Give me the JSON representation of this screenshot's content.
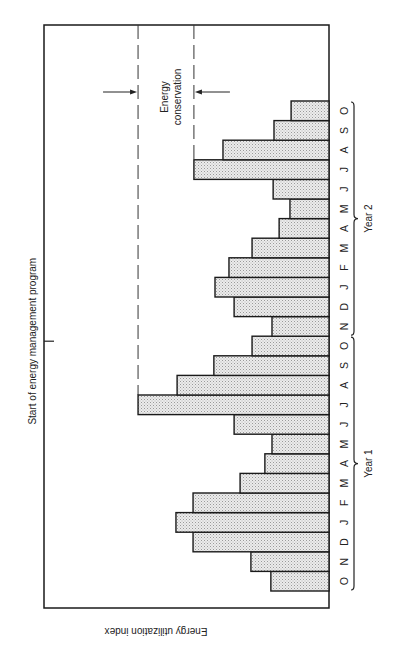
{
  "chart_data": {
    "type": "bar",
    "orientation": "rotated 90° counter-clockwise (time runs bottom to top, bars extend leftward from baseline)",
    "title": "",
    "xlabel": "",
    "ylabel": "Energy utilization index",
    "value_units": "relative index (no numeric scale printed; 100 = full height of plot frame)",
    "ylim": [
      0,
      100
    ],
    "grid": false,
    "categories": [
      "O",
      "N",
      "D",
      "J",
      "F",
      "M",
      "A",
      "M",
      "J",
      "J",
      "A",
      "S",
      "O",
      "N",
      "D",
      "J",
      "F",
      "M",
      "A",
      "M",
      "J",
      "J",
      "A",
      "S",
      "O"
    ],
    "values": [
      20.4,
      27.4,
      47.7,
      53.7,
      47.7,
      31.2,
      22.5,
      20.0,
      33.3,
      67.0,
      53.3,
      40.4,
      27.0,
      20.0,
      33.3,
      40.0,
      35.1,
      27.0,
      17.5,
      13.7,
      19.6,
      47.4,
      37.2,
      19.3,
      13.3
    ],
    "groups": [
      {
        "label": "Year 1",
        "from_index": 0,
        "to_index": 12
      },
      {
        "label": "Year 2",
        "from_index": 13,
        "to_index": 24
      }
    ],
    "annotations": {
      "program_start": {
        "label": "Start of energy management program",
        "after_index": 12
      },
      "conservation": {
        "label_line1": "Energy",
        "label_line2": "conservation",
        "peak_before": 67.0,
        "peak_after": 47.4
      }
    }
  }
}
